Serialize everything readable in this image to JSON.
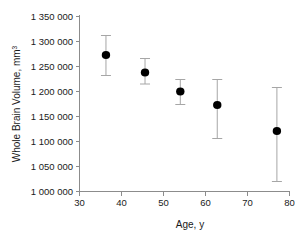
{
  "chart_data": {
    "type": "scatter",
    "title": "",
    "xlabel": "Age, y",
    "ylabel": "Whole Brain Volume, mm³",
    "ylabel_base": "Whole Brain Volume, mm",
    "ylabel_sup": "3",
    "xlim": [
      30,
      80
    ],
    "ylim": [
      1000000,
      1350000
    ],
    "grid": false,
    "legend": "none",
    "marker_color": "#000000",
    "errorbar_color": "#a6a6a6",
    "axis_color": "#8c8c8c",
    "x_ticks": [
      30,
      40,
      50,
      60,
      70,
      80
    ],
    "x_tick_labels": [
      "30",
      "40",
      "50",
      "60",
      "70",
      "80"
    ],
    "y_ticks": [
      1000000,
      1050000,
      1100000,
      1150000,
      1200000,
      1250000,
      1300000,
      1350000
    ],
    "y_tick_labels": [
      "1 000 000",
      "1 050 000",
      "1 100 000",
      "1 150 000",
      "1 200 000",
      "1 250 000",
      "1 300 000",
      "1 350 000"
    ],
    "x": [
      36.3,
      45.6,
      54.0,
      62.8,
      77.0
    ],
    "y": [
      1273000,
      1238000,
      1200000,
      1173000,
      1121000
    ],
    "y_err_upper": [
      1312000,
      1266000,
      1224000,
      1224000,
      1208000
    ],
    "y_err_lower": [
      1232000,
      1215000,
      1174000,
      1106000,
      1020000
    ],
    "points": [
      {
        "age": 36.3,
        "volume": 1273000,
        "upper": 1312000,
        "lower": 1232000
      },
      {
        "age": 45.6,
        "volume": 1238000,
        "upper": 1266000,
        "lower": 1215000
      },
      {
        "age": 54.0,
        "volume": 1200000,
        "upper": 1224000,
        "lower": 1174000
      },
      {
        "age": 62.8,
        "volume": 1173000,
        "upper": 1224000,
        "lower": 1106000
      },
      {
        "age": 77.0,
        "volume": 1121000,
        "upper": 1208000,
        "lower": 1020000
      }
    ]
  }
}
